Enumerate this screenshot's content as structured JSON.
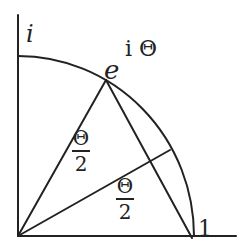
{
  "diagram": {
    "type": "geometry",
    "labels": {
      "i": "i",
      "e_base": "e",
      "e_exp": "i Θ",
      "one": "1",
      "half_angle_upper_num": "Θ",
      "half_angle_upper_den": "2",
      "half_angle_lower_num": "Θ",
      "half_angle_lower_den": "2"
    },
    "colors": {
      "stroke": "#222222",
      "background": "#ffffff"
    }
  }
}
